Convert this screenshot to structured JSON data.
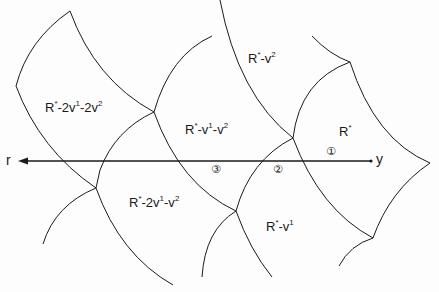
{
  "diagram": {
    "axis": {
      "left_label": "r",
      "right_label": "y"
    },
    "markers": [
      {
        "id": "1",
        "glyph": "①"
      },
      {
        "id": "2",
        "glyph": "②"
      },
      {
        "id": "3",
        "glyph": "③"
      }
    ],
    "regions": [
      {
        "id": "r-2v1-2v2",
        "base": "R",
        "parts": [
          "*",
          "-2v",
          "1",
          "-2v",
          "2"
        ]
      },
      {
        "id": "r-v2",
        "base": "R",
        "parts": [
          "*",
          "-v",
          "2"
        ]
      },
      {
        "id": "r-v1-v2",
        "base": "R",
        "parts": [
          "*",
          "-v",
          "1",
          "-v",
          "2"
        ]
      },
      {
        "id": "r-star",
        "base": "R",
        "parts": [
          "*"
        ]
      },
      {
        "id": "r-2v1-v2",
        "base": "R",
        "parts": [
          "*",
          "-2v",
          "1",
          "-v",
          "2"
        ]
      },
      {
        "id": "r-v1",
        "base": "R",
        "parts": [
          "*",
          "-v",
          "1"
        ]
      }
    ],
    "colors": {
      "line": "#1a1a1a",
      "background": "#fdfdfd"
    }
  }
}
